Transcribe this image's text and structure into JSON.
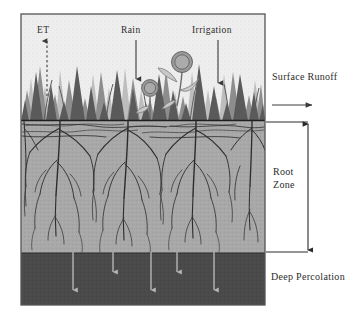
{
  "figure": {
    "frame": {
      "x": 21,
      "y": 14,
      "width": 244,
      "height": 291,
      "border_color": "#4a4a4a"
    }
  },
  "labels": {
    "et": "ET",
    "rain": "Rain",
    "irrigation": "Irrigation",
    "surface_runoff": "Surface Runoff",
    "root_zone_line1": "Root",
    "root_zone_line2": "Zone",
    "deep_percolation": "Deep Percolation"
  },
  "icons": {
    "et_arrow": "arrow-up-dashed-icon",
    "rain_arrow": "arrow-down-icon",
    "irrigation_arrow": "arrow-down-icon",
    "runoff_arrow": "arrow-right-icon",
    "root_zone_bracket": "double-headed-vertical-arrow-icon",
    "percolation_arrows": "arrow-down-icon"
  },
  "colors": {
    "sky": "#eeeeee",
    "root_zone_soil": "#a8a8a8",
    "deep_soil": "#4a4a4a",
    "grass_dark": "#5a5a5a",
    "grass_mid": "#8a8a8a",
    "grass_light": "#bdbdbd",
    "root_stroke": "#303030",
    "surface_line": "#232323",
    "text": "#2b2b2b",
    "percolation_arrow": "#b5b5b5",
    "frame_border": "#4a4a4a"
  },
  "layers": [
    {
      "name": "atmosphere",
      "label": "sky",
      "y_top": 14,
      "y_bottom": 120,
      "fill": "#eeeeee"
    },
    {
      "name": "root-zone",
      "label": "Root Zone",
      "y_top": 120,
      "y_bottom": 253,
      "fill": "#a8a8a8"
    },
    {
      "name": "deep-percolation-zone",
      "label": "Deep Percolation",
      "y_top": 253,
      "y_bottom": 305,
      "fill": "#4a4a4a"
    }
  ],
  "flows": [
    {
      "name": "ET",
      "direction": "up",
      "x": 47,
      "from_y": 96,
      "to_y": 40
    },
    {
      "name": "Rain",
      "direction": "down",
      "x": 136,
      "from_y": 40,
      "to_y": 80
    },
    {
      "name": "Irrigation",
      "direction": "down",
      "x": 218,
      "from_y": 40,
      "to_y": 84
    },
    {
      "name": "Surface Runoff",
      "direction": "right",
      "y": 105,
      "from_x": 272,
      "to_x": 313
    }
  ],
  "percolation_arrows_x": [
    73,
    113,
    151,
    177,
    214
  ],
  "plants": [
    {
      "name": "flower-small",
      "cx": 150,
      "cy": 88,
      "r": 8
    },
    {
      "name": "flower-large",
      "cx": 182,
      "cy": 62,
      "r": 10
    }
  ],
  "bracket": {
    "name": "root-zone-depth-bracket",
    "x": 308,
    "top_y": 122,
    "bottom_y": 252,
    "connector_left_x": 266
  }
}
